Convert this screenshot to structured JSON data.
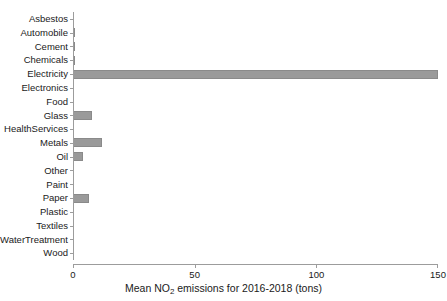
{
  "chart_data": {
    "type": "bar",
    "orientation": "horizontal",
    "title": "",
    "xlabel_parts": {
      "before": "Mean NO",
      "subscript": "2",
      "after": " emissions for 2016-2018 (tons)"
    },
    "xlabel": "Mean NO2 emissions for 2016-2018 (tons)",
    "ylabel": "",
    "xlim": [
      0,
      150
    ],
    "xticks": [
      0,
      50,
      100,
      150
    ],
    "xtick_labels": [
      "0",
      "50",
      "100",
      "150"
    ],
    "grid": false,
    "legend": false,
    "bar_color": "#9a9a9a",
    "bar_edge_color": "#8a8a8a",
    "axis_color": "#9c9c9c",
    "categories": [
      "Asbestos",
      "Automobile",
      "Cement",
      "Chemicals",
      "Electricity",
      "Electronics",
      "Food",
      "Glass",
      "HealthServices",
      "Metals",
      "Oil",
      "Other",
      "Paint",
      "Paper",
      "Plastic",
      "Textiles",
      "WaterTreatment",
      "Wood"
    ],
    "values": [
      0,
      1,
      1,
      1,
      150,
      0,
      0,
      8,
      0,
      12,
      4,
      0,
      0,
      6.5,
      0,
      0,
      0,
      0
    ]
  }
}
